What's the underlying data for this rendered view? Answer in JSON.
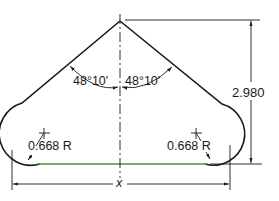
{
  "drawing": {
    "type": "technical-dimensioned-profile",
    "colors": {
      "outline": "#1a1a1a",
      "base_line": "#4f8f35",
      "background": "#ffffff"
    },
    "labels": {
      "angle_left": "48°10'",
      "angle_right": "48°10'",
      "height": "2.980",
      "radius_left": "0.668 R",
      "radius_right": "0.668 R",
      "width": "x"
    }
  }
}
